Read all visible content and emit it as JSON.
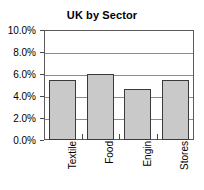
{
  "chart_data": {
    "type": "bar",
    "title": "UK by Sector",
    "xlabel": "",
    "ylabel": "",
    "categories": [
      "Textile",
      "Food",
      "Engin",
      "Stores"
    ],
    "values": [
      5.5,
      6.0,
      4.65,
      5.5
    ],
    "value_suffix": "%",
    "ylim": [
      0,
      10
    ],
    "ytick_values": [
      0.0,
      2.0,
      4.0,
      6.0,
      8.0,
      10.0
    ],
    "ytick_labels": [
      "0.0%",
      "2.0%",
      "4.0%",
      "6.0%",
      "8.0%",
      "10.0%"
    ],
    "grid": true,
    "legend": false,
    "series": [
      {
        "name": "UK by Sector",
        "values": [
          5.5,
          6.0,
          4.65,
          5.5
        ]
      }
    ]
  },
  "colors": {
    "bar_fill": "#c9c9c9",
    "bar_outline": "#3a3a3a",
    "gridline": "#8c8c8c",
    "frame": "#5a5a5a",
    "text": "#000000",
    "background": "#ffffff"
  }
}
